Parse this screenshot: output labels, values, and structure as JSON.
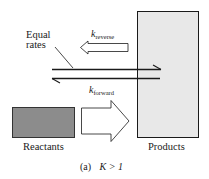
{
  "diagram": {
    "type": "equilibrium-rates",
    "labels": {
      "equal_rates_line1": "Equal",
      "equal_rates_line2": "rates",
      "k_reverse_symbol": "k",
      "k_reverse_sub": "reverse",
      "k_forward_symbol": "k",
      "k_forward_sub": "forward",
      "reactants": "Reactants",
      "products": "Products",
      "caption_prefix": "(a)",
      "caption_condition": "K > 1"
    },
    "colors": {
      "reactants_fill": "#8c8c8c",
      "products_fill": "#e8e8e8",
      "stroke": "#1a1a1a",
      "arrow_fill": "#ffffff"
    }
  }
}
